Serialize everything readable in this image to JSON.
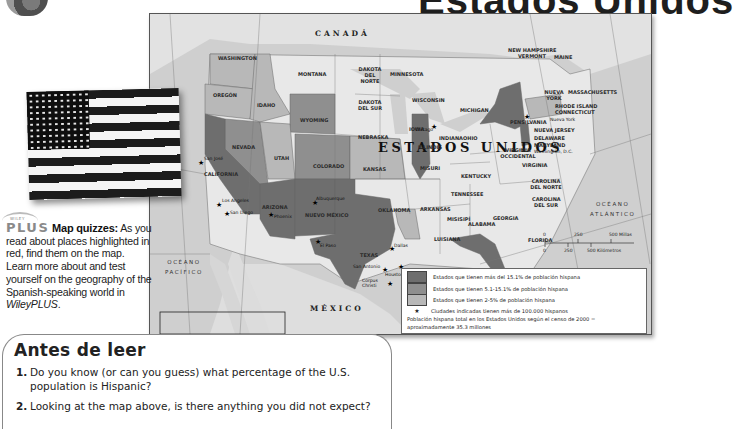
{
  "page": {
    "title": "Estados Unidos"
  },
  "map": {
    "country_labels": {
      "canada": "CANADÁ",
      "usa": "ESTADOS UNIDOS",
      "mexico": "MÉXICO"
    },
    "water_labels": {
      "pacific": "OCÉANO\nPACÍFICO",
      "atlantic": "OCÉANO\nATLÁNTICO",
      "gulf": "GOLFO DE MÉXICO"
    },
    "states": [
      {
        "name": "WASHINGTON",
        "category": "light"
      },
      {
        "name": "OREGÓN",
        "category": "light"
      },
      {
        "name": "IDAHO",
        "category": "light"
      },
      {
        "name": "MONTANA",
        "category": "none"
      },
      {
        "name": "WYOMING",
        "category": "medium"
      },
      {
        "name": "NEVADA",
        "category": "medium"
      },
      {
        "name": "UTAH",
        "category": "light"
      },
      {
        "name": "COLORADO",
        "category": "medium"
      },
      {
        "name": "CALIFORNIA",
        "category": "dark"
      },
      {
        "name": "ARIZONA",
        "category": "dark"
      },
      {
        "name": "NUEVO MÉXICO",
        "category": "dark"
      },
      {
        "name": "TEXAS",
        "category": "dark"
      },
      {
        "name": "DAKOTA DEL NORTE",
        "category": "none"
      },
      {
        "name": "DAKOTA DEL SUR",
        "category": "none"
      },
      {
        "name": "NEBRASKA",
        "category": "none"
      },
      {
        "name": "KANSAS",
        "category": "light"
      },
      {
        "name": "OKLAHOMA",
        "category": "none"
      },
      {
        "name": "MINNESOTA",
        "category": "none"
      },
      {
        "name": "IOWA",
        "category": "none"
      },
      {
        "name": "MISURI",
        "category": "none"
      },
      {
        "name": "ARKANSAS",
        "category": "none"
      },
      {
        "name": "LUISIANA",
        "category": "light"
      },
      {
        "name": "WISCONSIN",
        "category": "none"
      },
      {
        "name": "ILLINOIS",
        "category": "dark"
      },
      {
        "name": "MICHIGAN",
        "category": "none"
      },
      {
        "name": "INDIANA",
        "category": "none"
      },
      {
        "name": "OHIO",
        "category": "none"
      },
      {
        "name": "KENTUCKY",
        "category": "none"
      },
      {
        "name": "TENNESSEE",
        "category": "none"
      },
      {
        "name": "MISISIPÍ",
        "category": "none"
      },
      {
        "name": "ALABAMA",
        "category": "none"
      },
      {
        "name": "GEORGIA",
        "category": "none"
      },
      {
        "name": "FLORIDA",
        "category": "dark"
      },
      {
        "name": "CAROLINA DEL SUR",
        "category": "none"
      },
      {
        "name": "CAROLINA DEL NORTE",
        "category": "none"
      },
      {
        "name": "VIRGINIA",
        "category": "none"
      },
      {
        "name": "VIRGINIA OCCIDENTAL",
        "category": "none"
      },
      {
        "name": "PENSILVANIA",
        "category": "none"
      },
      {
        "name": "NUEVA YORK",
        "category": "dark"
      },
      {
        "name": "NUEVA JERSEY",
        "category": "dark"
      },
      {
        "name": "DELAWARE",
        "category": "none"
      },
      {
        "name": "MARYLAND",
        "category": "none"
      },
      {
        "name": "MASSACHUSETTS",
        "category": "light"
      },
      {
        "name": "RHODE ISLAND",
        "category": "light"
      },
      {
        "name": "CONNECTICUT",
        "category": "light"
      },
      {
        "name": "NEW HAMPSHIRE",
        "category": "none"
      },
      {
        "name": "VERMONT",
        "category": "none"
      },
      {
        "name": "MAINE",
        "category": "none"
      }
    ],
    "cities": [
      "San José",
      "Los Angeles",
      "San Diego",
      "Phoenix",
      "Albuquerque",
      "El Paso",
      "Dallas",
      "San Antonio",
      "Houston",
      "Corpus Christi",
      "Miami",
      "Chicago",
      "Nueva York",
      "Washington, D.C."
    ],
    "scale": {
      "miles_ticks": [
        "0",
        "250",
        "500 Millas"
      ],
      "km_ticks": [
        "0",
        "250",
        "500 Kilómetros"
      ]
    },
    "legend": {
      "items": [
        {
          "label": "Estados que tienen más del 15.1% de población hispana",
          "color": "#6e6e6e"
        },
        {
          "label": "Estados que tienen 5.1-15.1% de población hispana",
          "color": "#8f8f8f"
        },
        {
          "label": "Estados que tienen 2-5% de población hispana",
          "color": "#b8b8b8"
        }
      ],
      "star_label": "Ciudades indicadas tienen más de 100.000 hispanos",
      "note": "Población hispana total en los Estados Unidos según el censo de 2000 = aproximadamente 35.3 millones"
    },
    "colors": {
      "dark": "#6e6e6e",
      "medium": "#8f8f8f",
      "light": "#b8b8b8",
      "none": "#e8e8e8",
      "water": "#cfcfcf",
      "foreign_land": "#dedede"
    }
  },
  "sidebar": {
    "logo_small": "WILEY",
    "logo": "PLUS",
    "title": "Map quizzes:",
    "body": " As you read about places highlighted in red, find them on the map. Learn more about and test yourself on the geography of the Spanish-speaking world in ",
    "italic": "WileyPLUS",
    "end": "."
  },
  "antes": {
    "title": "Antes de leer",
    "questions": [
      {
        "num": "1.",
        "text": "Do you know (or can you guess) what percentage of the U.S. population is Hispanic?"
      },
      {
        "num": "2.",
        "text": "Looking at the map above, is there anything you did not expect?"
      }
    ]
  }
}
